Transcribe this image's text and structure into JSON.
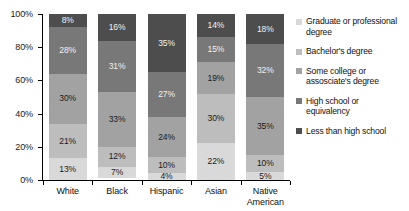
{
  "chart_data": {
    "type": "bar",
    "subtype": "stacked-bar-100-percent",
    "title": "",
    "xlabel": "",
    "ylabel": "",
    "ylim": [
      0,
      100
    ],
    "yticks": [
      "0%",
      "20%",
      "40%",
      "60%",
      "80%",
      "100%"
    ],
    "ytick_values": [
      0,
      20,
      40,
      60,
      80,
      100
    ],
    "grid": false,
    "legend_position": "right",
    "categories": [
      "White",
      "Black",
      "Hispanic",
      "Asian",
      "Native American"
    ],
    "series": [
      {
        "name": "Graduate or professional degree",
        "color": "#d9d9d9",
        "label_color": "#1a1a1a",
        "values": [
          13,
          7,
          4,
          22,
          5
        ],
        "labels": [
          "13%",
          "7%",
          "4%",
          "22%",
          "5%"
        ]
      },
      {
        "name": "Bachelor's degree",
        "color": "#bdbdbd",
        "label_color": "#1a1a1a",
        "values": [
          21,
          12,
          10,
          30,
          10
        ],
        "labels": [
          "21%",
          "12%",
          "10%",
          "30%",
          "10%"
        ]
      },
      {
        "name": "Some college or assosciate's degree",
        "color": "#a2a2a2",
        "label_color": "#1a1a1a",
        "values": [
          30,
          33,
          24,
          19,
          35
        ],
        "labels": [
          "30%",
          "33%",
          "24%",
          "19%",
          "35%"
        ]
      },
      {
        "name": "High school or equivalency",
        "color": "#787878",
        "label_color": "#f2f2f2",
        "values": [
          28,
          31,
          27,
          15,
          32
        ],
        "labels": [
          "28%",
          "31%",
          "27%",
          "15%",
          "32%"
        ]
      },
      {
        "name": "Less than high school",
        "color": "#4d4d4d",
        "label_color": "#f2f2f2",
        "values": [
          8,
          16,
          35,
          14,
          18
        ],
        "labels": [
          "8%",
          "16%",
          "35%",
          "14%",
          "18%"
        ]
      }
    ],
    "legend_entries": [
      {
        "label_line1": "Graduate or professional",
        "label_line2": "degree",
        "color": "#d9d9d9"
      },
      {
        "label_line1": "Bachelor's degree",
        "label_line2": "",
        "color": "#bdbdbd"
      },
      {
        "label_line1": "Some college or",
        "label_line2": "assosciate's degree",
        "color": "#a2a2a2"
      },
      {
        "label_line1": "High school or",
        "label_line2": "equivalency",
        "color": "#787878"
      },
      {
        "label_line1": "Less than high school",
        "label_line2": "",
        "color": "#4d4d4d"
      }
    ],
    "category_labels": [
      {
        "line1": "White",
        "line2": ""
      },
      {
        "line1": "Black",
        "line2": ""
      },
      {
        "line1": "Hispanic",
        "line2": ""
      },
      {
        "line1": "Asian",
        "line2": ""
      },
      {
        "line1": "Native",
        "line2": "American"
      }
    ]
  }
}
